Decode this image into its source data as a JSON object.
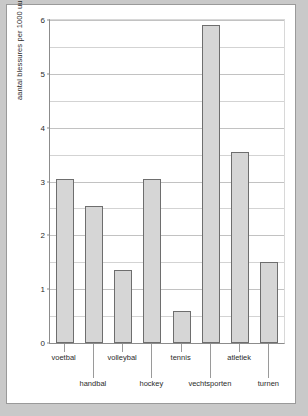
{
  "chart_data": {
    "type": "bar",
    "title": "",
    "subtitle": "",
    "xlabel": "",
    "ylabel": "aantal blessures per 1000 uur sportbeoefening",
    "categories": [
      "voetbal",
      "handbal",
      "volleybal",
      "hockey",
      "tennis",
      "vechtsporten",
      "atletiek",
      "turnen"
    ],
    "values": [
      3.05,
      2.55,
      1.35,
      3.05,
      0.6,
      5.9,
      3.55,
      1.5
    ],
    "ylim": [
      0,
      6
    ],
    "y_major_ticks": [
      0,
      1,
      2,
      3,
      4,
      5,
      6
    ],
    "y_major_tick_labels": [
      "0",
      "1",
      "2",
      "3",
      "4",
      "5",
      "6"
    ],
    "y_minor_gridlines": [
      0.5,
      1.5,
      2.5,
      3.5,
      4.5,
      5.5
    ],
    "grid": true,
    "legend": null,
    "legend_position": "none",
    "label_layout": "staggered-two-rows",
    "bar_fill_color": "#d6d6d6",
    "bar_edge_color": "#6e6e6e",
    "plot_background_color": "#ffffff",
    "page_background_color": "#c9c9c9",
    "frame_color": "#9a9a9a",
    "axis_color": "#8c8c8c",
    "gridline_color": "#d3d3d3",
    "text_color": "#2b2b2b"
  }
}
